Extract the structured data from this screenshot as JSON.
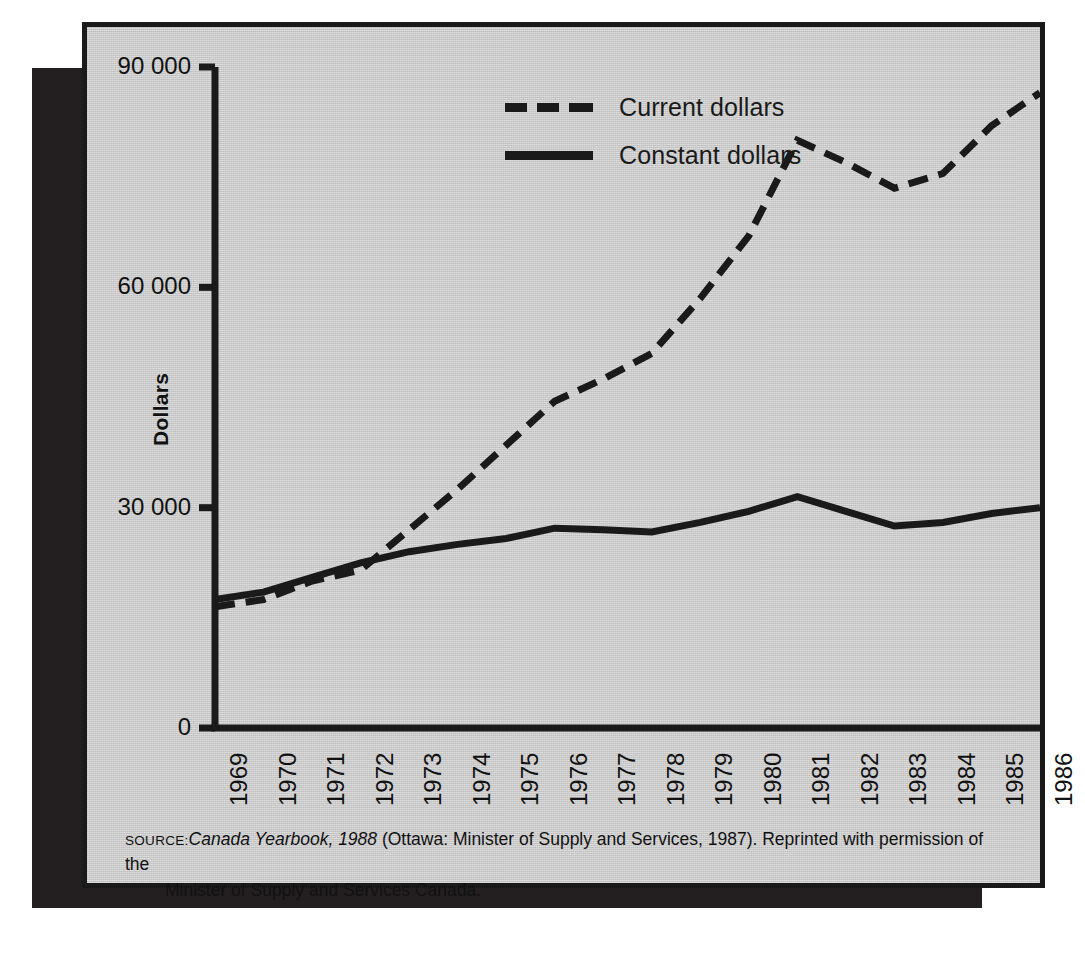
{
  "figure": {
    "background_color": "#c9c9c9",
    "ink_color": "#1a1a1a",
    "shadow_color": "#231f20"
  },
  "legend": {
    "position": "top-center-right",
    "items": [
      {
        "label": "Current dollars",
        "style": "dashed"
      },
      {
        "label": "Constant dollars",
        "style": "solid"
      }
    ]
  },
  "axes": {
    "y_title": "Dollars",
    "y_ticks": [
      "90 000",
      "60 000",
      "30 000",
      "0"
    ],
    "x_ticks": [
      "1969",
      "1970",
      "1971",
      "1972",
      "1973",
      "1974",
      "1975",
      "1976",
      "1977",
      "1978",
      "1979",
      "1980",
      "1981",
      "1982",
      "1983",
      "1984",
      "1985",
      "1986"
    ]
  },
  "source": {
    "label": "SOURCE:",
    "title": "Canada Yearbook, 1988",
    "rest": " (Ottawa: Minister of Supply and Services, 1987). Reprinted with permission of the",
    "line2": "Minister of Supply and Services Canada."
  },
  "chart_data": {
    "type": "line",
    "title": "",
    "xlabel": "",
    "ylabel": "Dollars",
    "xlim": [
      1969,
      1986
    ],
    "ylim": [
      0,
      90000
    ],
    "yticks": [
      0,
      30000,
      60000,
      90000
    ],
    "ytick_labels": [
      "0",
      "30 000",
      "60 000",
      "90 000"
    ],
    "grid": false,
    "legend_position": "upper center",
    "x": [
      1969,
      1970,
      1971,
      1972,
      1973,
      1974,
      1975,
      1976,
      1977,
      1978,
      1979,
      1980,
      1981,
      1982,
      1983,
      1984,
      1985,
      1986
    ],
    "series": [
      {
        "name": "Current dollars",
        "style": "dashed",
        "color": "#1a1a1a",
        "values": [
          16500,
          17500,
          20000,
          21500,
          27000,
          32500,
          38500,
          44500,
          47500,
          51000,
          58500,
          67000,
          80000,
          77000,
          73500,
          75500,
          82000,
          86500
        ]
      },
      {
        "name": "Constant dollars",
        "style": "solid",
        "color": "#1a1a1a",
        "values": [
          17500,
          18500,
          20500,
          22500,
          24000,
          25000,
          25800,
          27200,
          27000,
          26700,
          28000,
          29500,
          31500,
          29500,
          27500,
          28000,
          29200,
          30000
        ]
      }
    ]
  }
}
